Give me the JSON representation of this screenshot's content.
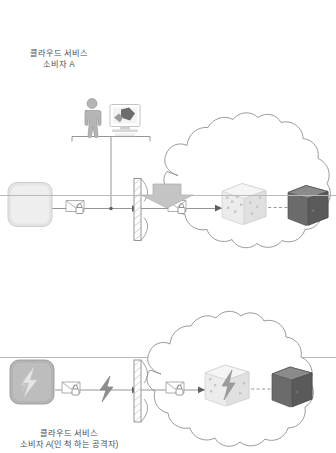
{
  "diagram": {
    "panels": [
      {
        "id": "normal-scenario",
        "label_line1": "클라우드 서비스",
        "label_line2": "소비자 A",
        "actor_icon": "person-icon",
        "workstation_icon": "monitor-icon",
        "client_icon": "rounded-device-icon",
        "message_icon": "encrypted-message-icon",
        "firewall_icon": "firewall-icon",
        "cloud_icon": "cloud-outline",
        "cloud_message_icon": "encrypted-message-icon",
        "cluster_icon": "light-server-cluster-icon",
        "server_icon": "dark-server-icon"
      },
      {
        "id": "attack-scenario",
        "label_line1": "클라우드 서비스",
        "label_line2": "소비자 A(인 척 하는 공격자)",
        "client_icon": "rounded-attacker-device-icon",
        "message_icon": "encrypted-message-icon",
        "attack_icon": "lightning-bolt-icon",
        "firewall_icon": "firewall-icon",
        "cloud_icon": "cloud-outline",
        "cloud_message_icon": "encrypted-message-icon",
        "cluster_icon": "compromised-server-cluster-icon",
        "server_icon": "dark-server-icon"
      }
    ],
    "transition_icon": "down-arrow-icon",
    "colors": {
      "line": "#8a8a8a",
      "cloud_stroke": "#8f8f8f",
      "light_gray": "#d9d9d9",
      "mid_gray": "#a6a6a6",
      "dark_gray": "#5f5f5f",
      "text": "#4a4a4a",
      "divider": "#b9b9b9"
    }
  }
}
